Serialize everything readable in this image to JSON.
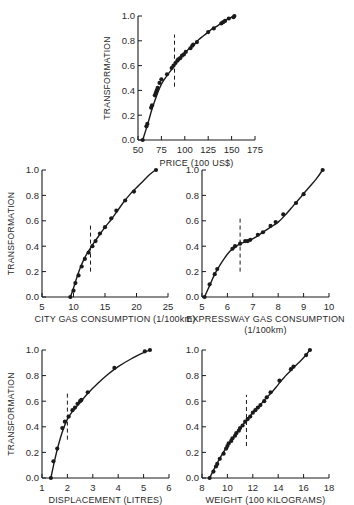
{
  "figure": {
    "ylabel": "TRANSFORMATION",
    "stroke_color": "#1a1a1a",
    "background": "#ffffff"
  },
  "chart_data": [
    {
      "id": "price",
      "type": "line",
      "title": "",
      "xlabel": "PRICE (100 US$)",
      "xlabel2": "",
      "ylabel": "TRANSFORMATION",
      "xlim": [
        50,
        175
      ],
      "ylim": [
        0,
        1.0
      ],
      "xticks": [
        50,
        75,
        100,
        125,
        150,
        175
      ],
      "xtick_labels": [
        "50",
        "75",
        "100",
        "125",
        "150",
        "175"
      ],
      "yticks": [
        0.0,
        0.2,
        0.4,
        0.6,
        0.8,
        1.0
      ],
      "ytick_labels": [
        "0.0",
        "0.2",
        "0.4",
        "0.6",
        "0.8",
        "1.0"
      ],
      "dashed_marker_x": 89,
      "dashed_marker_y": [
        0.43,
        0.85
      ],
      "show_ylabel": true,
      "frame": {
        "x0": 138,
        "x1": 255,
        "y0": 140,
        "y1": 16,
        "label_y": 153,
        "xlabel_y": 166
      },
      "curve": [
        [
          55,
          0.0
        ],
        [
          60,
          0.12
        ],
        [
          65,
          0.25
        ],
        [
          70,
          0.36
        ],
        [
          75,
          0.45
        ],
        [
          80,
          0.51
        ],
        [
          85,
          0.56
        ],
        [
          90,
          0.62
        ],
        [
          95,
          0.66
        ],
        [
          100,
          0.7
        ],
        [
          105,
          0.74
        ],
        [
          110,
          0.77
        ],
        [
          115,
          0.81
        ],
        [
          120,
          0.84
        ],
        [
          125,
          0.87
        ],
        [
          130,
          0.9
        ],
        [
          135,
          0.92
        ],
        [
          140,
          0.95
        ],
        [
          145,
          0.97
        ],
        [
          150,
          0.99
        ],
        [
          153,
          1.0
        ]
      ],
      "points": [
        [
          55,
          0.0
        ],
        [
          59,
          0.11
        ],
        [
          60,
          0.13
        ],
        [
          64,
          0.26
        ],
        [
          65,
          0.28
        ],
        [
          68,
          0.36
        ],
        [
          69,
          0.38
        ],
        [
          70,
          0.4
        ],
        [
          71,
          0.42
        ],
        [
          73,
          0.46
        ],
        [
          75,
          0.49
        ],
        [
          81,
          0.53
        ],
        [
          86,
          0.58
        ],
        [
          88,
          0.6
        ],
        [
          90,
          0.62
        ],
        [
          92,
          0.64
        ],
        [
          93,
          0.65
        ],
        [
          95,
          0.66
        ],
        [
          97,
          0.68
        ],
        [
          99,
          0.69
        ],
        [
          101,
          0.71
        ],
        [
          106,
          0.74
        ],
        [
          108,
          0.76
        ],
        [
          109,
          0.77
        ],
        [
          113,
          0.79
        ],
        [
          125,
          0.87
        ],
        [
          131,
          0.9
        ],
        [
          139,
          0.94
        ],
        [
          141,
          0.95
        ],
        [
          143,
          0.96
        ],
        [
          147,
          0.98
        ],
        [
          152,
          0.99
        ],
        [
          153,
          1.0
        ]
      ]
    },
    {
      "id": "city_gas",
      "type": "line",
      "title": "",
      "xlabel": "CITY GAS CONSUMPTION (1/100km)",
      "xlabel2": "",
      "ylabel": "TRANSFORMATION",
      "xlim": [
        5,
        25
      ],
      "ylim": [
        0,
        1.0
      ],
      "xticks": [
        5,
        10,
        15,
        20,
        25
      ],
      "xtick_labels": [
        "5",
        "10",
        "15",
        "20",
        "25"
      ],
      "yticks": [
        0.0,
        0.2,
        0.4,
        0.6,
        0.8,
        1.0
      ],
      "ytick_labels": [
        "0.0",
        "0.2",
        "0.4",
        "0.6",
        "0.8",
        "1.0"
      ],
      "dashed_marker_x": 12.7,
      "dashed_marker_y": [
        0.2,
        0.58
      ],
      "show_ylabel": true,
      "frame": {
        "x0": 42,
        "x1": 168,
        "y0": 297,
        "y1": 170,
        "label_y": 310,
        "xlabel_y": 322
      },
      "curve": [
        [
          9.5,
          0.0
        ],
        [
          10,
          0.07
        ],
        [
          10.5,
          0.15
        ],
        [
          11,
          0.22
        ],
        [
          11.5,
          0.28
        ],
        [
          12,
          0.33
        ],
        [
          12.5,
          0.37
        ],
        [
          13,
          0.41
        ],
        [
          14,
          0.48
        ],
        [
          15,
          0.55
        ],
        [
          16,
          0.61
        ],
        [
          17,
          0.68
        ],
        [
          18,
          0.75
        ],
        [
          19,
          0.81
        ],
        [
          20,
          0.86
        ],
        [
          21,
          0.91
        ],
        [
          22,
          0.96
        ],
        [
          23,
          1.0
        ]
      ],
      "points": [
        [
          9.5,
          0.0
        ],
        [
          10,
          0.05
        ],
        [
          10.3,
          0.11
        ],
        [
          10.8,
          0.17
        ],
        [
          11.3,
          0.24
        ],
        [
          11.8,
          0.3
        ],
        [
          12.4,
          0.35
        ],
        [
          13,
          0.4
        ],
        [
          13.5,
          0.44
        ],
        [
          14.2,
          0.5
        ],
        [
          15,
          0.55
        ],
        [
          16,
          0.62
        ],
        [
          16.8,
          0.68
        ],
        [
          18.2,
          0.76
        ],
        [
          19.6,
          0.83
        ],
        [
          23.1,
          1.0
        ]
      ]
    },
    {
      "id": "expressway_gas",
      "type": "line",
      "title": "",
      "xlabel": "EXPRESSWAY GAS CONSUMPTION",
      "xlabel2": "(1/100km)",
      "ylabel": "",
      "xlim": [
        5,
        10
      ],
      "ylim": [
        0,
        1.0
      ],
      "xticks": [
        5,
        6,
        7,
        8,
        9,
        10
      ],
      "xtick_labels": [
        "5",
        "6",
        "7",
        "8",
        "9",
        "10"
      ],
      "yticks": [
        0.0,
        0.2,
        0.4,
        0.6,
        0.8,
        1.0
      ],
      "ytick_labels": [
        "0.0",
        "0.2",
        "0.4",
        "0.6",
        "0.8",
        "1.0"
      ],
      "dashed_marker_x": 6.5,
      "dashed_marker_y": [
        0.2,
        0.62
      ],
      "show_ylabel": false,
      "frame": {
        "x0": 202,
        "x1": 329,
        "y0": 297,
        "y1": 170,
        "label_y": 310,
        "xlabel_y": 322
      },
      "curve": [
        [
          5.1,
          0.0
        ],
        [
          5.3,
          0.09
        ],
        [
          5.5,
          0.18
        ],
        [
          5.7,
          0.25
        ],
        [
          5.9,
          0.31
        ],
        [
          6.1,
          0.36
        ],
        [
          6.3,
          0.39
        ],
        [
          6.5,
          0.42
        ],
        [
          6.8,
          0.44
        ],
        [
          7.1,
          0.47
        ],
        [
          7.4,
          0.51
        ],
        [
          7.7,
          0.55
        ],
        [
          8.0,
          0.59
        ],
        [
          8.3,
          0.65
        ],
        [
          8.6,
          0.72
        ],
        [
          8.9,
          0.79
        ],
        [
          9.2,
          0.86
        ],
        [
          9.5,
          0.93
        ],
        [
          9.75,
          1.0
        ]
      ],
      "points": [
        [
          5.1,
          0.0
        ],
        [
          5.3,
          0.1
        ],
        [
          5.5,
          0.18
        ],
        [
          5.6,
          0.22
        ],
        [
          6.2,
          0.38
        ],
        [
          6.3,
          0.4
        ],
        [
          6.5,
          0.42
        ],
        [
          6.7,
          0.44
        ],
        [
          6.8,
          0.44
        ],
        [
          6.9,
          0.45
        ],
        [
          7.2,
          0.49
        ],
        [
          7.4,
          0.51
        ],
        [
          7.7,
          0.56
        ],
        [
          7.9,
          0.59
        ],
        [
          8.2,
          0.65
        ],
        [
          8.7,
          0.74
        ],
        [
          9.0,
          0.81
        ],
        [
          9.75,
          1.0
        ]
      ]
    },
    {
      "id": "displacement",
      "type": "line",
      "title": "",
      "xlabel": "DISPLACEMENT (LITRES)",
      "xlabel2": "",
      "ylabel": "TRANSFORMATION",
      "xlim": [
        1,
        6
      ],
      "ylim": [
        0,
        1.0
      ],
      "xticks": [
        1,
        2,
        3,
        4,
        5,
        6
      ],
      "xtick_labels": [
        "1",
        "2",
        "3",
        "4",
        "5",
        "6"
      ],
      "yticks": [
        0.0,
        0.2,
        0.4,
        0.6,
        0.8,
        1.0
      ],
      "ytick_labels": [
        "0.0",
        "0.2",
        "0.4",
        "0.6",
        "0.8",
        "1.0"
      ],
      "dashed_marker_x": 2.0,
      "dashed_marker_y": [
        0.3,
        0.68
      ],
      "show_ylabel": true,
      "frame": {
        "x0": 42,
        "x1": 169,
        "y0": 478,
        "y1": 350,
        "label_y": 491,
        "xlabel_y": 503
      },
      "curve": [
        [
          1.35,
          0.0
        ],
        [
          1.5,
          0.14
        ],
        [
          1.65,
          0.26
        ],
        [
          1.8,
          0.36
        ],
        [
          2.0,
          0.46
        ],
        [
          2.2,
          0.52
        ],
        [
          2.5,
          0.59
        ],
        [
          2.8,
          0.66
        ],
        [
          3.2,
          0.74
        ],
        [
          3.6,
          0.81
        ],
        [
          4.0,
          0.87
        ],
        [
          4.5,
          0.93
        ],
        [
          5.0,
          0.98
        ],
        [
          5.25,
          1.0
        ]
      ],
      "points": [
        [
          1.35,
          0.0
        ],
        [
          1.45,
          0.13
        ],
        [
          1.6,
          0.23
        ],
        [
          1.8,
          0.39
        ],
        [
          1.9,
          0.44
        ],
        [
          2.05,
          0.48
        ],
        [
          2.2,
          0.53
        ],
        [
          2.3,
          0.55
        ],
        [
          2.4,
          0.58
        ],
        [
          2.5,
          0.6
        ],
        [
          2.55,
          0.61
        ],
        [
          2.8,
          0.67
        ],
        [
          3.85,
          0.86
        ],
        [
          5.05,
          0.99
        ],
        [
          5.25,
          1.0
        ]
      ]
    },
    {
      "id": "weight",
      "type": "line",
      "title": "",
      "xlabel": "WEIGHT (100 KILOGRAMS)",
      "xlabel2": "",
      "ylabel": "",
      "xlim": [
        8,
        18
      ],
      "ylim": [
        0,
        1.0
      ],
      "xticks": [
        8,
        10,
        12,
        14,
        16,
        18
      ],
      "xtick_labels": [
        "8",
        "10",
        "12",
        "14",
        "16",
        "18"
      ],
      "yticks": [
        0.0,
        0.2,
        0.4,
        0.6,
        0.8,
        1.0
      ],
      "ytick_labels": [
        "0.0",
        "0.2",
        "0.4",
        "0.6",
        "0.8",
        "1.0"
      ],
      "dashed_marker_x": 11.5,
      "dashed_marker_y": [
        0.25,
        0.65
      ],
      "show_ylabel": false,
      "frame": {
        "x0": 202,
        "x1": 329,
        "y0": 478,
        "y1": 350,
        "label_y": 491,
        "xlabel_y": 503
      },
      "curve": [
        [
          8.6,
          0.0
        ],
        [
          9.0,
          0.08
        ],
        [
          9.5,
          0.17
        ],
        [
          10.0,
          0.25
        ],
        [
          10.5,
          0.32
        ],
        [
          11.0,
          0.39
        ],
        [
          11.5,
          0.45
        ],
        [
          12.0,
          0.51
        ],
        [
          12.5,
          0.56
        ],
        [
          13.0,
          0.62
        ],
        [
          13.5,
          0.67
        ],
        [
          14.0,
          0.73
        ],
        [
          14.5,
          0.79
        ],
        [
          15.0,
          0.84
        ],
        [
          15.5,
          0.89
        ],
        [
          16.0,
          0.94
        ],
        [
          16.5,
          1.0
        ]
      ],
      "points": [
        [
          8.6,
          0.0
        ],
        [
          8.9,
          0.05
        ],
        [
          9.1,
          0.09
        ],
        [
          9.2,
          0.11
        ],
        [
          9.4,
          0.15
        ],
        [
          9.7,
          0.19
        ],
        [
          9.9,
          0.23
        ],
        [
          10.0,
          0.25
        ],
        [
          10.1,
          0.27
        ],
        [
          10.3,
          0.29
        ],
        [
          10.4,
          0.31
        ],
        [
          10.6,
          0.33
        ],
        [
          10.7,
          0.35
        ],
        [
          10.9,
          0.37
        ],
        [
          11.0,
          0.39
        ],
        [
          11.2,
          0.41
        ],
        [
          11.4,
          0.44
        ],
        [
          11.6,
          0.46
        ],
        [
          11.8,
          0.48
        ],
        [
          12.0,
          0.51
        ],
        [
          12.2,
          0.53
        ],
        [
          12.4,
          0.55
        ],
        [
          12.6,
          0.57
        ],
        [
          12.9,
          0.6
        ],
        [
          13.1,
          0.63
        ],
        [
          13.4,
          0.67
        ],
        [
          14.1,
          0.76
        ],
        [
          15.0,
          0.85
        ],
        [
          15.2,
          0.87
        ],
        [
          16.2,
          0.96
        ],
        [
          16.5,
          1.0
        ]
      ]
    }
  ]
}
